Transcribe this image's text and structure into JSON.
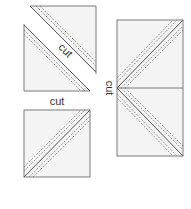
{
  "diagram": {
    "labels": {
      "diagonal_cut": "cut",
      "between_cut": "cut",
      "vertical_cut": "cut"
    },
    "colors": {
      "fabric_fill": "#f4f4f4",
      "outline": "#7a7a7a",
      "cut_line": "#555555",
      "seam_line": "#777777"
    },
    "pieces": [
      {
        "name": "top-triangle",
        "shape": "triangle"
      },
      {
        "name": "lower-triangle",
        "shape": "triangle"
      },
      {
        "name": "bottom-square",
        "shape": "square"
      },
      {
        "name": "right-rectangle",
        "shape": "rectangle (two squares)"
      }
    ]
  }
}
